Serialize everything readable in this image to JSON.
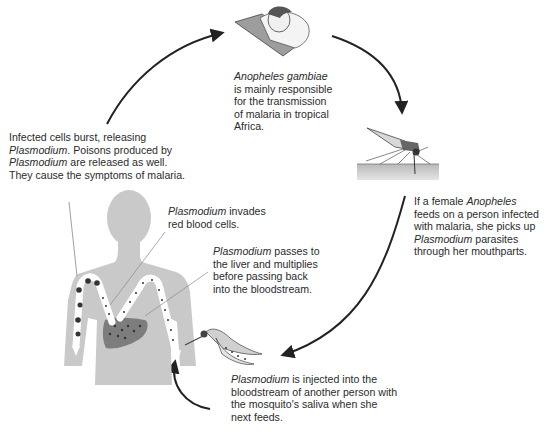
{
  "diagram": {
    "type": "cycle",
    "colors": {
      "arrow": "#222222",
      "body": "#c9c9c9",
      "liver": "#7d7d7d",
      "vessel": "#ffffff",
      "text": "#2b2b2b"
    },
    "captions": {
      "top": {
        "italic": "Anopheles gambiae",
        "lines": [
          "is mainly responsible",
          "for the transmission",
          "of malaria in tropical",
          "Africa."
        ]
      },
      "left": {
        "line1": "Infected cells burst, releasing",
        "line2_italic": "Plasmodium",
        "line2_rest": ". Poisons produced by",
        "line3_italic": "Plasmodium",
        "line3_rest": " are released as well.",
        "line4": "They cause the symptoms of malaria."
      },
      "right": {
        "line1_pre": "If a female ",
        "line1_italic": "Anopheles",
        "line2": "feeds on a person infected",
        "line3": "with malaria, she picks up",
        "line4_italic": "Plasmodium",
        "line4_rest": " parasites",
        "line5": "through her mouthparts."
      },
      "invades": {
        "line1_italic": "Plasmodium",
        "line1_rest": " invades",
        "line2": "red blood cells."
      },
      "liver": {
        "line1_italic": "Plasmodium",
        "line1_rest": " passes to",
        "line2": "the liver and multiplies",
        "line3": "before passing back",
        "line4": "into the bloodstream."
      },
      "bottom": {
        "line1_italic": "Plasmodium",
        "line1_rest": " is injected into the",
        "line2": "bloodstream of another person with",
        "line3": "the mosquito's saliva when she",
        "line4": "next feeds."
      }
    },
    "stages": [
      {
        "name": "sleeping-person",
        "icon": "person-in-bed"
      },
      {
        "name": "mosquito-feeding",
        "icon": "mosquito-on-skin"
      },
      {
        "name": "mosquito-injecting",
        "icon": "mosquito-cross-section"
      },
      {
        "name": "human-body",
        "icon": "human-torso-with-liver"
      }
    ]
  }
}
